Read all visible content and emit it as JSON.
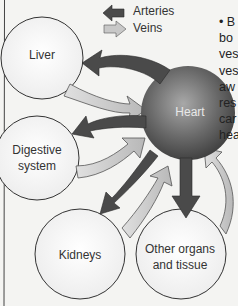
{
  "legend": {
    "arteries": {
      "label": "Arteries",
      "color": "#4a4a4a",
      "direction": "left"
    },
    "veins": {
      "label": "Veins",
      "color": "#c4c4c4",
      "direction": "right"
    }
  },
  "nodes": {
    "liver": {
      "label": "Liver"
    },
    "digestive": {
      "label_line1": "Digestive",
      "label_line2": "system"
    },
    "heart": {
      "label": "Heart"
    },
    "kidneys": {
      "label": "Kidneys"
    },
    "other": {
      "label_line1": "Other organs",
      "label_line2": "and tissue"
    }
  },
  "side_text": {
    "lines": [
      "• B",
      "bo",
      "ves",
      "ves",
      "aw",
      "res",
      "car",
      "hea"
    ]
  },
  "colors": {
    "artery": "#4a4a4a",
    "vein": "#c2c2c2",
    "heart_dark": "#3c3c3c",
    "heart_light": "#8a8a8a",
    "organ_fill": "#fafafa",
    "outline": "#333333"
  }
}
